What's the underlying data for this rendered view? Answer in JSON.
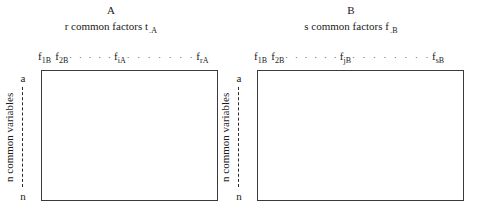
{
  "figure": {
    "background_color": "#ffffff",
    "line_color": "#3a3a3a",
    "text_color": "#1a1a1a"
  },
  "panels": [
    {
      "id": "A",
      "letter": "A",
      "factors_caption": "r common factors t",
      "factors_caption_subscript": ".A",
      "row_axis_label": "n common variables",
      "row_index_first": "a",
      "row_index_last": "n",
      "column_labels": [
        {
          "symbol": "f",
          "subscript": "1B"
        },
        {
          "symbol": "f",
          "subscript": "2B"
        },
        {
          "symbol": "f",
          "subscript": "iA"
        },
        {
          "symbol": "f",
          "subscript": "rA"
        }
      ],
      "ellipsis_1": ". . . . .",
      "ellipsis_2": ". . . . . . ."
    },
    {
      "id": "B",
      "letter": "B",
      "factors_caption": "s common factors f",
      "factors_caption_subscript": ".B",
      "row_axis_label": "n common variables",
      "row_index_first": "a",
      "row_index_last": "n",
      "column_labels": [
        {
          "symbol": "f",
          "subscript": "1B"
        },
        {
          "symbol": "f",
          "subscript": "2B"
        },
        {
          "symbol": "f",
          "subscript": "jB"
        },
        {
          "symbol": "f",
          "subscript": "sB"
        }
      ],
      "ellipsis_1": ". . . . . .",
      "ellipsis_2": ". . . . . . . ."
    }
  ]
}
